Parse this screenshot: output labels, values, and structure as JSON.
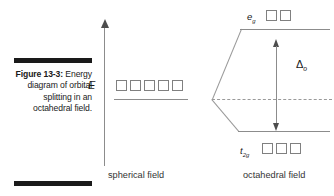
{
  "figure": {
    "caption_label": "Figure 13-3:",
    "caption_body": "Energy diagram of orbital splitting in an octahedral field."
  },
  "axis": {
    "energy_label": "E",
    "arrow_direction": "up"
  },
  "diagram": {
    "spherical": {
      "field_caption": "spherical field",
      "orbital_count": 5
    },
    "octahedral": {
      "field_caption": "octahedral field",
      "levels": [
        {
          "label_main": "e",
          "label_sub": "g",
          "orbital_count": 2,
          "position": "upper"
        },
        {
          "label_main": "t",
          "label_sub": "2g",
          "orbital_count": 3,
          "position": "lower"
        }
      ]
    },
    "splitting": {
      "symbol_main": "Δ",
      "symbol_sub": "o"
    }
  },
  "colors": {
    "rule": "#1a1a1a",
    "line": "#8c8c8c",
    "box_border": "#808080",
    "text": "#1a1a1a"
  }
}
